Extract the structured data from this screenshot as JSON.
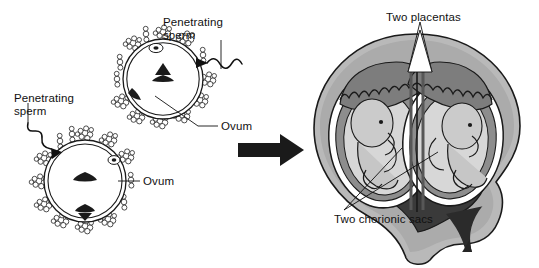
{
  "figure": {
    "background_color": "#ffffff",
    "ink_color": "#111111"
  },
  "left_panel": {
    "name": "two-ova-fertilization",
    "labels": {
      "sperm_upper": "Penetrating\nsperm",
      "sperm_lower": "Penetrating\nsperm",
      "ovum_upper": "Ovum",
      "ovum_lower": "Ovum"
    },
    "ova": [
      {
        "id": "upper-ovum",
        "cx": 163,
        "cy": 79,
        "r": 40,
        "corona_cells": 13,
        "sperm_entry_angle_deg": 18
      },
      {
        "id": "lower-ovum",
        "cx": 85,
        "cy": 181,
        "r": 41,
        "corona_cells": 13,
        "sperm_entry_angle_deg": 208
      }
    ]
  },
  "transition": {
    "name": "process-arrow",
    "direction": "right",
    "color": "#1a1a1a"
  },
  "right_panel": {
    "name": "uterus-with-dizygotic-twins",
    "labels": {
      "placentas": "Two placentas",
      "chorionic_sacs": "Two chorionic sacs"
    },
    "fetuses": 2,
    "placentas": 2,
    "chorionic_sacs": 2,
    "amniotic_sacs": 2,
    "colors": {
      "myometrium": "#b9b9b9",
      "myometrium_dark": "#8f8f8f",
      "cavity": "#3a3a3a",
      "decidua": "#6f6f6f",
      "placenta": "#7d7d7d",
      "chorion": "#ffffff",
      "amnion_fluid": "#d9d9d9",
      "fetus": "#c9c9c9",
      "outline": "#1a1a1a"
    }
  }
}
